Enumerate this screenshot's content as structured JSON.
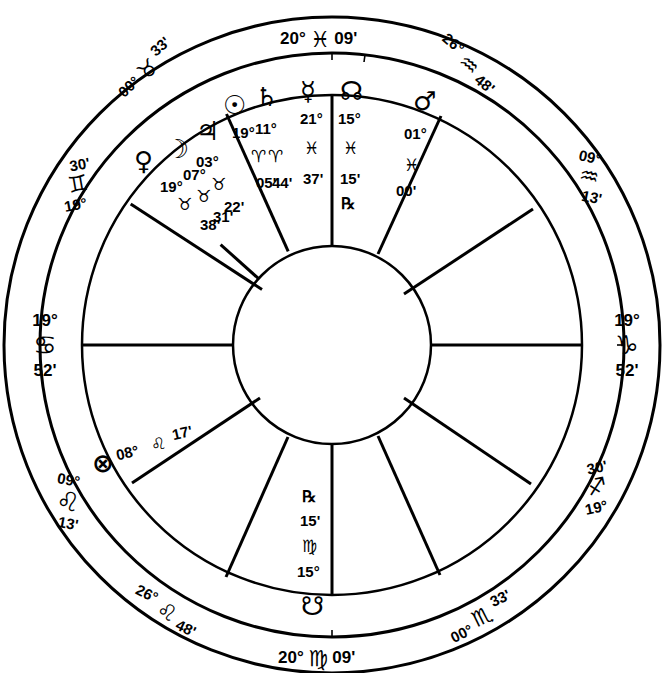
{
  "chart": {
    "style": "wheel",
    "stroke_color": "#000000",
    "background": "#ffffff"
  },
  "angles": {
    "mc": {
      "degree": "20°",
      "sign": "♓",
      "minute": "09'",
      "sign_name": "Pisces",
      "position": "top"
    },
    "ic": {
      "degree": "20°",
      "sign": "♍",
      "minute": "09'",
      "sign_name": "Virgo",
      "position": "bottom"
    },
    "asc": {
      "degree": "19°",
      "sign": "♋",
      "minute": "52'",
      "sign_name": "Cancer",
      "position": "left"
    },
    "dsc": {
      "degree": "19°",
      "sign": "♑",
      "minute": "52'",
      "sign_name": "Capricorn",
      "position": "right"
    }
  },
  "cusps": [
    {
      "id": "cusp-taurus",
      "degree": "00°",
      "sign": "♉",
      "minute": "33'",
      "sign_name": "Taurus"
    },
    {
      "id": "cusp-aquarius-upper",
      "degree": "26°",
      "sign": "♒",
      "minute": "48'",
      "sign_name": "Aquarius"
    },
    {
      "id": "cusp-gemini",
      "degree": "19°",
      "sign": "♊",
      "minute": "30'",
      "sign_name": "Gemini"
    },
    {
      "id": "cusp-aquarius-lower",
      "degree": "09°",
      "sign": "♒",
      "minute": "13'",
      "sign_name": "Aquarius"
    },
    {
      "id": "cusp-leo-upper",
      "degree": "09°",
      "sign": "♌",
      "minute": "13'",
      "sign_name": "Leo"
    },
    {
      "id": "cusp-sagittarius",
      "degree": "19°",
      "sign": "♐",
      "minute": "30'",
      "sign_name": "Sagittarius"
    },
    {
      "id": "cusp-leo-lower",
      "degree": "26°",
      "sign": "♌",
      "minute": "48'",
      "sign_name": "Leo"
    },
    {
      "id": "cusp-scorpio",
      "degree": "00°",
      "sign": "♏",
      "minute": "33'",
      "sign_name": "Scorpio"
    }
  ],
  "planets": [
    {
      "id": "venus",
      "name": "Venus",
      "glyph": "♀",
      "degree": "19°",
      "sign": "♉",
      "sign_name": "Taurus",
      "minute": "38'",
      "retrograde": ""
    },
    {
      "id": "moon",
      "name": "Moon",
      "glyph": "☽",
      "degree": "07°",
      "sign": "♉",
      "sign_name": "Taurus",
      "minute": "31'",
      "retrograde": ""
    },
    {
      "id": "jupiter",
      "name": "Jupiter",
      "glyph": "♃",
      "degree": "03°",
      "sign": "♉",
      "sign_name": "Taurus",
      "minute": "22'",
      "retrograde": ""
    },
    {
      "id": "sun",
      "name": "Sun",
      "glyph": "☉",
      "degree": "19°",
      "sign": "♈",
      "sign_name": "Aries",
      "minute": "05'",
      "retrograde": ""
    },
    {
      "id": "saturn",
      "name": "Saturn",
      "glyph": "♄",
      "degree": "11°",
      "sign": "♈",
      "sign_name": "Aries",
      "minute": "44'",
      "retrograde": ""
    },
    {
      "id": "mercury",
      "name": "Mercury",
      "glyph": "☿",
      "degree": "21°",
      "sign": "♓",
      "sign_name": "Pisces",
      "minute": "37'",
      "retrograde": ""
    },
    {
      "id": "north-node",
      "name": "North Node",
      "glyph": "☊",
      "degree": "15°",
      "sign": "♓",
      "sign_name": "Pisces",
      "minute": "15'",
      "retrograde": "℞"
    },
    {
      "id": "mars",
      "name": "Mars",
      "glyph": "♂",
      "degree": "01°",
      "sign": "♓",
      "sign_name": "Pisces",
      "minute": "00'",
      "retrograde": ""
    },
    {
      "id": "south-node",
      "name": "South Node",
      "glyph": "☋",
      "degree": "15°",
      "sign": "♍",
      "sign_name": "Virgo",
      "minute": "15'",
      "retrograde": "℞"
    },
    {
      "id": "part-of-fortune",
      "name": "Part of Fortune",
      "glyph": "⊗",
      "degree": "08°",
      "sign": "♌",
      "sign_name": "Leo",
      "minute": "17'",
      "retrograde": ""
    }
  ]
}
